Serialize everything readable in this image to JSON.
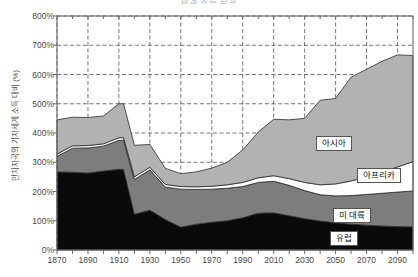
{
  "chart_data": {
    "type": "area",
    "stacked": true,
    "title": "세계 소득 분포",
    "xlabel": "",
    "ylabel": "만지자곡의 기자세계 소득 대비 (%)",
    "xlim": [
      1870,
      2100
    ],
    "ylim": [
      0,
      800
    ],
    "grid": true,
    "legend_position": "inline-annotations",
    "y_tick_labels": [
      "800%",
      "700%",
      "600%",
      "500%",
      "400%",
      "300%",
      "200%",
      "100%",
      "0%"
    ],
    "y_tick_values": [
      800,
      700,
      600,
      500,
      400,
      300,
      200,
      100,
      0
    ],
    "x_tick_labels": [
      "1870",
      "1890",
      "1910",
      "1930",
      "1950",
      "1970",
      "1990",
      "2010",
      "2030",
      "2050",
      "2070",
      "2090"
    ],
    "x_tick_values": [
      1870,
      1890,
      1910,
      1930,
      1950,
      1970,
      1990,
      2010,
      2030,
      2050,
      2070,
      2090
    ],
    "x_minor_tick_step": 10,
    "x": [
      1870,
      1880,
      1890,
      1900,
      1910,
      1913,
      1920,
      1930,
      1940,
      1950,
      1960,
      1970,
      1980,
      1990,
      2000,
      2010,
      2020,
      2030,
      2040,
      2050,
      2060,
      2070,
      2080,
      2090,
      2100
    ],
    "series": [
      {
        "name": "유럽",
        "label": "유럽",
        "color": "#0a0a0a",
        "values": [
          267,
          266,
          263,
          270,
          276,
          275,
          122,
          136,
          104,
          78,
          88,
          95,
          100,
          110,
          126,
          127,
          117,
          107,
          99,
          93,
          88,
          85,
          82,
          80,
          79
        ]
      },
      {
        "name": "미 대륙",
        "label": "미 대륙",
        "color": "#7d7d7d",
        "values": [
          53,
          82,
          86,
          85,
          99,
          100,
          119,
          138,
          111,
          130,
          119,
          113,
          111,
          107,
          105,
          108,
          104,
          96,
          90,
          92,
          98,
          105,
          112,
          118,
          123
        ]
      },
      {
        "name": "아프리카",
        "label": "아프리카",
        "color": "#ffffff",
        "values": [
          8,
          8,
          8,
          8,
          9,
          9,
          9,
          9,
          9,
          9,
          9,
          10,
          12,
          14,
          16,
          19,
          23,
          28,
          34,
          41,
          50,
          60,
          72,
          86,
          100
        ]
      },
      {
        "name": "아시아",
        "label": "아시아",
        "color": "#b2b2b2",
        "values": [
          117,
          98,
          96,
          95,
          116,
          116,
          108,
          78,
          55,
          44,
          51,
          62,
          77,
          111,
          156,
          193,
          201,
          219,
          289,
          292,
          355,
          368,
          379,
          383,
          363
        ]
      }
    ],
    "totals": [
      445,
      454,
      453,
      458,
      500,
      500,
      358,
      361,
      279,
      261,
      267,
      280,
      300,
      342,
      403,
      447,
      445,
      450,
      512,
      518,
      591,
      618,
      645,
      667,
      665
    ]
  }
}
